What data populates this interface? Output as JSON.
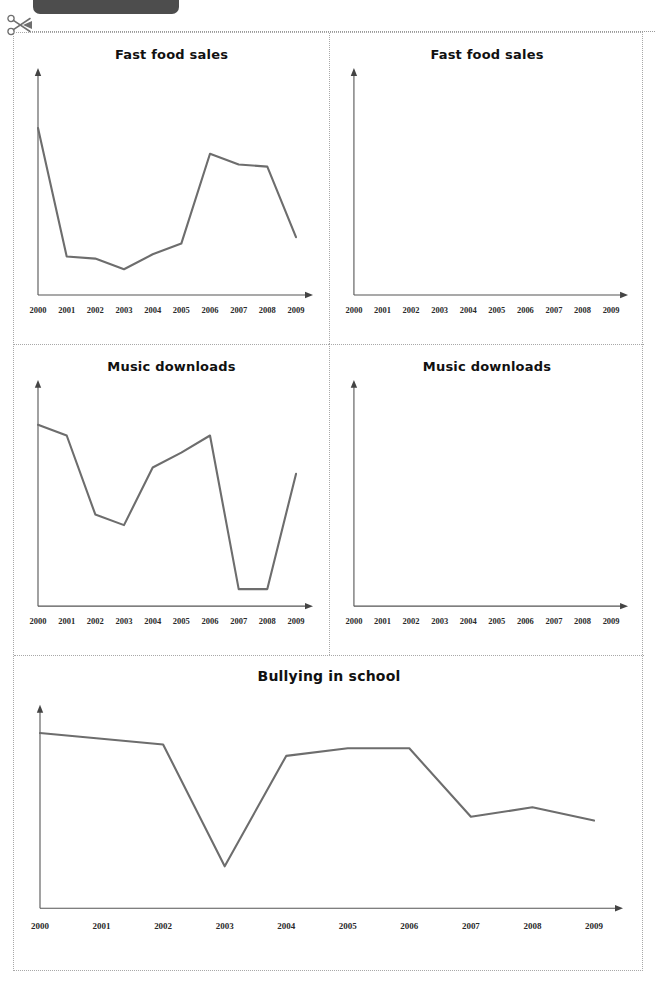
{
  "page": {
    "header_ghost_text": "",
    "cut_line_icon": "scissors-icon"
  },
  "colors": {
    "line": "#6d6d6d",
    "axis": "#555555",
    "title": "#111111",
    "panel_border": "#a8a8a8",
    "header_bar": "#4d4d4d"
  },
  "chart_data": [
    {
      "id": "fast-food-sales-filled",
      "type": "line",
      "title": "Fast food sales",
      "xlabel": "",
      "ylabel": "",
      "grid": false,
      "legend": "none",
      "categories": [
        "2000",
        "2001",
        "2002",
        "2003",
        "2004",
        "2005",
        "2006",
        "2007",
        "2008",
        "2009"
      ],
      "xlim": [
        "2000",
        "2009"
      ],
      "ylim": [
        0,
        100
      ],
      "values": [
        78,
        18,
        17,
        12,
        19,
        24,
        66,
        61,
        60,
        27
      ],
      "blank": false
    },
    {
      "id": "fast-food-sales-blank",
      "type": "line",
      "title": "Fast food sales",
      "xlabel": "",
      "ylabel": "",
      "grid": false,
      "legend": "none",
      "categories": [
        "2000",
        "2001",
        "2002",
        "2003",
        "2004",
        "2005",
        "2006",
        "2007",
        "2008",
        "2009"
      ],
      "xlim": [
        "2000",
        "2009"
      ],
      "ylim": [
        0,
        100
      ],
      "values": [],
      "blank": true
    },
    {
      "id": "music-downloads-filled",
      "type": "line",
      "title": "Music downloads",
      "xlabel": "",
      "ylabel": "",
      "grid": false,
      "legend": "none",
      "categories": [
        "2000",
        "2001",
        "2002",
        "2003",
        "2004",
        "2005",
        "2006",
        "2007",
        "2008",
        "2009"
      ],
      "xlim": [
        "2000",
        "2009"
      ],
      "ylim": [
        0,
        100
      ],
      "values": [
        85,
        80,
        43,
        38,
        65,
        72,
        80,
        8,
        8,
        62
      ],
      "blank": false
    },
    {
      "id": "music-downloads-blank",
      "type": "line",
      "title": "Music downloads",
      "xlabel": "",
      "ylabel": "",
      "grid": false,
      "legend": "none",
      "categories": [
        "2000",
        "2001",
        "2002",
        "2003",
        "2004",
        "2005",
        "2006",
        "2007",
        "2008",
        "2009"
      ],
      "xlim": [
        "2000",
        "2009"
      ],
      "ylim": [
        0,
        100
      ],
      "values": [],
      "blank": true
    },
    {
      "id": "bullying-in-school-filled",
      "type": "line",
      "title": "Bullying in school",
      "xlabel": "",
      "ylabel": "",
      "grid": false,
      "legend": "none",
      "categories": [
        "2000",
        "2001",
        "2002",
        "2003",
        "2004",
        "2005",
        "2006",
        "2007",
        "2008",
        "2009"
      ],
      "xlim": [
        "2000",
        "2009"
      ],
      "ylim": [
        0,
        100
      ],
      "values": [
        92,
        89,
        86,
        22,
        80,
        84,
        84,
        48,
        53,
        46
      ],
      "blank": false
    }
  ]
}
